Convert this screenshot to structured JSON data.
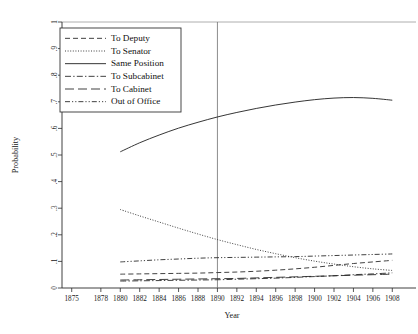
{
  "chart_data": {
    "type": "line",
    "title": "",
    "xlabel": "Year",
    "ylabel": "Probability",
    "xlim": [
      1874,
      1909
    ],
    "ylim": [
      0,
      1
    ],
    "grid": false,
    "legend_position": "top-left",
    "x_ticks": [
      1875,
      1878,
      1880,
      1882,
      1884,
      1886,
      1888,
      1890,
      1892,
      1894,
      1896,
      1898,
      1900,
      1902,
      1904,
      1906,
      1908
    ],
    "y_ticks": [
      0,
      0.1,
      0.2,
      0.3,
      0.4,
      0.5,
      0.6,
      0.7,
      0.8,
      0.9,
      1
    ],
    "y_tick_labels": [
      "0",
      ".1",
      ".2",
      ".3",
      ".4",
      ".5",
      ".6",
      ".7",
      ".8",
      ".9",
      "1"
    ],
    "x_tick_labels": [
      "1875",
      "1878",
      "1880",
      "1882",
      "1884",
      "1886",
      "1888",
      "1890",
      "1892",
      "1894",
      "1896",
      "1898",
      "1900",
      "1902",
      "1904",
      "1906",
      "1908"
    ],
    "annotations": [
      {
        "name": "reference-line-1890",
        "type": "vline",
        "x": 1890
      },
      {
        "name": "probability-one-line",
        "type": "hline",
        "y": 1
      }
    ],
    "x": [
      1880,
      1882,
      1884,
      1886,
      1888,
      1890,
      1892,
      1894,
      1896,
      1898,
      1900,
      1902,
      1904,
      1906,
      1908
    ],
    "series": [
      {
        "name": "To Deputy",
        "style": "dashed",
        "values": [
          0.052,
          0.053,
          0.054,
          0.055,
          0.056,
          0.058,
          0.06,
          0.063,
          0.067,
          0.072,
          0.078,
          0.085,
          0.092,
          0.098,
          0.104
        ]
      },
      {
        "name": "To Senator",
        "style": "dotted",
        "values": [
          0.295,
          0.271,
          0.248,
          0.225,
          0.203,
          0.182,
          0.163,
          0.145,
          0.129,
          0.114,
          0.101,
          0.09,
          0.08,
          0.072,
          0.066
        ]
      },
      {
        "name": "Same Position",
        "style": "solid",
        "values": [
          0.512,
          0.546,
          0.575,
          0.601,
          0.623,
          0.643,
          0.66,
          0.675,
          0.688,
          0.699,
          0.708,
          0.714,
          0.716,
          0.713,
          0.706
        ]
      },
      {
        "name": "To Subcabinet",
        "style": "dash-dot",
        "values": [
          0.026,
          0.027,
          0.028,
          0.029,
          0.03,
          0.031,
          0.033,
          0.035,
          0.037,
          0.04,
          0.043,
          0.046,
          0.05,
          0.053,
          0.057
        ]
      },
      {
        "name": "To Cabinet",
        "style": "long-dash",
        "values": [
          0.03,
          0.031,
          0.032,
          0.033,
          0.034,
          0.035,
          0.036,
          0.038,
          0.04,
          0.042,
          0.044,
          0.046,
          0.048,
          0.05,
          0.052
        ]
      },
      {
        "name": "Out of Office",
        "style": "dash-dot-dot",
        "values": [
          0.098,
          0.102,
          0.106,
          0.109,
          0.112,
          0.114,
          0.115,
          0.116,
          0.117,
          0.118,
          0.12,
          0.122,
          0.124,
          0.126,
          0.128
        ]
      }
    ]
  },
  "legend": {
    "entries": [
      {
        "label": "To Deputy"
      },
      {
        "label": "To Senator"
      },
      {
        "label": "Same Position"
      },
      {
        "label": "To Subcabinet"
      },
      {
        "label": "To Cabinet"
      },
      {
        "label": "Out of Office"
      }
    ]
  }
}
